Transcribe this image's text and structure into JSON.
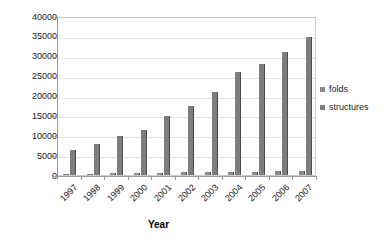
{
  "chart_data": {
    "type": "bar",
    "title": "",
    "subtitle": "",
    "xlabel": "Year",
    "ylabel": "",
    "categories": [
      "1997",
      "1998",
      "1999",
      "2000",
      "2001",
      "2002",
      "2003",
      "2004",
      "2005",
      "2006",
      "2007"
    ],
    "series": [
      {
        "name": "folds",
        "color": "#8a8a8a",
        "values": [
          280,
          350,
          420,
          500,
          600,
          650,
          700,
          800,
          850,
          900,
          950
        ]
      },
      {
        "name": "structures",
        "color": "#7d7d7d",
        "values": [
          6300,
          7800,
          9700,
          11200,
          14900,
          17300,
          20900,
          25900,
          27900,
          30900,
          34800
        ]
      }
    ],
    "ylim": [
      0,
      40000
    ],
    "ytick_step": 5000,
    "yticks": [
      "40000",
      "35000",
      "30000",
      "25000",
      "20000",
      "15000",
      "10000",
      "5000",
      "0"
    ],
    "ytick_values": [
      40000,
      35000,
      30000,
      25000,
      20000,
      15000,
      10000,
      5000,
      0
    ],
    "grid": true,
    "grid_axis": "y",
    "legend_position": "right",
    "legend": [
      "folds",
      "structures"
    ],
    "plot_background": "#ffffff",
    "grid_color": "#e2e2e2",
    "axis_color": "#9a9a9a"
  }
}
